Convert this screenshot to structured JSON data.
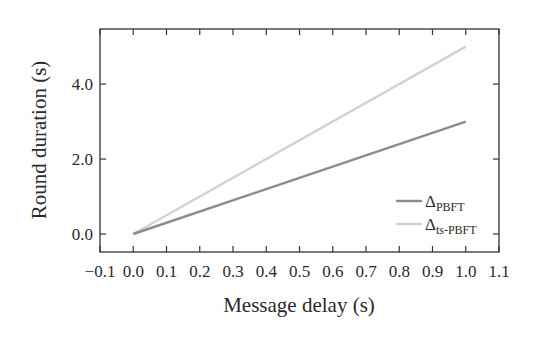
{
  "chart_data": {
    "type": "line",
    "title": "",
    "xlabel": "Message delay (s)",
    "ylabel": "Round duration (s)",
    "xlim": [
      -0.1,
      1.1
    ],
    "ylim": [
      -0.48,
      5.47
    ],
    "xticks": [
      -0.1,
      0.0,
      0.1,
      0.2,
      0.3,
      0.4,
      0.5,
      0.6,
      0.7,
      0.8,
      0.9,
      1.0,
      1.1
    ],
    "xtick_labels": [
      "−0.1",
      "0.0",
      "0.1",
      "0.2",
      "0.3",
      "0.4",
      "0.5",
      "0.6",
      "0.7",
      "0.8",
      "0.9",
      "1.0",
      "1.1"
    ],
    "yticks": [
      0.0,
      2.0,
      4.0
    ],
    "ytick_labels": [
      "0.0",
      "2.0",
      "4.0"
    ],
    "grid": false,
    "legend_position": "lower right",
    "series": [
      {
        "name": "ΔPBFT",
        "symbol": "Δ",
        "subscript": "PBFT",
        "color": "#8c8c8c",
        "x": [
          0.0,
          1.0
        ],
        "y": [
          0.0,
          3.0
        ]
      },
      {
        "name": "Δts-PBFT",
        "symbol": "Δ",
        "subscript": "ts-PBFT",
        "color": "#d2d2d2",
        "x": [
          0.0,
          1.0
        ],
        "y": [
          0.0,
          5.0
        ]
      }
    ]
  }
}
